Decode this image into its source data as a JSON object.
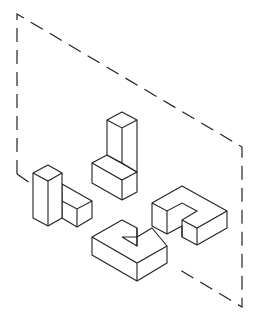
{
  "figure": {
    "title": "",
    "colors": {
      "stroke": "#222222",
      "background": "#ffffff"
    },
    "plane": {
      "style": "dashed",
      "corners": [
        [
          17,
          14
        ],
        [
          242,
          147
        ],
        [
          242,
          307
        ],
        [
          17,
          174
        ]
      ]
    },
    "shapes": [
      {
        "id": "A",
        "name": "tall-pillar-with-step-block"
      },
      {
        "id": "B",
        "name": "tall-l-block"
      },
      {
        "id": "C",
        "name": "hook-block"
      },
      {
        "id": "D",
        "name": "c-shaped-block"
      }
    ]
  }
}
